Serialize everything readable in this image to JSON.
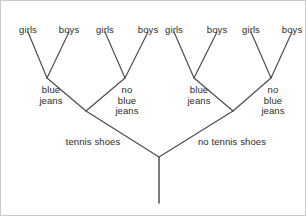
{
  "diagram": {
    "type": "dichotomous-classification-tree",
    "line_color": "#4a4a4a",
    "background_color": "#ffffff",
    "text_color": "#2b2b2b",
    "leaves": [
      {
        "id": "leaf-1",
        "label": "girls",
        "x": 27,
        "y": 24
      },
      {
        "id": "leaf-2",
        "label": "boys",
        "x": 68,
        "y": 24
      },
      {
        "id": "leaf-3",
        "label": "girls",
        "x": 104,
        "y": 24
      },
      {
        "id": "leaf-4",
        "label": "boys",
        "x": 147,
        "y": 24
      },
      {
        "id": "leaf-5",
        "label": "girls",
        "x": 173,
        "y": 24
      },
      {
        "id": "leaf-6",
        "label": "boys",
        "x": 216,
        "y": 24
      },
      {
        "id": "leaf-7",
        "label": "girls",
        "x": 250,
        "y": 24
      },
      {
        "id": "leaf-8",
        "label": "boys",
        "x": 291,
        "y": 24
      }
    ],
    "mid_labels": [
      {
        "id": "mid-1",
        "label": "blue\njeans",
        "x": 50,
        "y": 84
      },
      {
        "id": "mid-2",
        "label": "no\nblue\njeans",
        "x": 126,
        "y": 84
      },
      {
        "id": "mid-3",
        "label": "blue\njeans",
        "x": 198,
        "y": 84
      },
      {
        "id": "mid-4",
        "label": "no\nblue\njeans",
        "x": 272,
        "y": 84
      }
    ],
    "base_labels": [
      {
        "id": "base-1",
        "label": "tennis shoes",
        "x": 92,
        "y": 136
      },
      {
        "id": "base-2",
        "label": "no tennis shoes",
        "x": 231,
        "y": 136
      }
    ],
    "edges": [
      {
        "id": "edge-leaf1",
        "from": [
          27,
          31
        ],
        "to": [
          46,
          77
        ]
      },
      {
        "id": "edge-leaf2",
        "from": [
          68,
          31
        ],
        "to": [
          46,
          77
        ]
      },
      {
        "id": "edge-leaf3",
        "from": [
          104,
          31
        ],
        "to": [
          124,
          77
        ]
      },
      {
        "id": "edge-leaf4",
        "from": [
          147,
          31
        ],
        "to": [
          124,
          77
        ]
      },
      {
        "id": "edge-leaf5",
        "from": [
          173,
          31
        ],
        "to": [
          193,
          77
        ]
      },
      {
        "id": "edge-leaf6",
        "from": [
          216,
          31
        ],
        "to": [
          193,
          77
        ]
      },
      {
        "id": "edge-leaf7",
        "from": [
          250,
          31
        ],
        "to": [
          270,
          77
        ]
      },
      {
        "id": "edge-leaf8",
        "from": [
          291,
          31
        ],
        "to": [
          270,
          77
        ]
      },
      {
        "id": "edge-mid1",
        "from": [
          46,
          77
        ],
        "to": [
          85,
          110
        ]
      },
      {
        "id": "edge-mid2",
        "from": [
          124,
          77
        ],
        "to": [
          85,
          110
        ]
      },
      {
        "id": "edge-mid3",
        "from": [
          193,
          77
        ],
        "to": [
          232,
          110
        ]
      },
      {
        "id": "edge-mid4",
        "from": [
          270,
          77
        ],
        "to": [
          232,
          110
        ]
      },
      {
        "id": "edge-base1",
        "from": [
          85,
          110
        ],
        "to": [
          158,
          156
        ]
      },
      {
        "id": "edge-base2",
        "from": [
          232,
          110
        ],
        "to": [
          158,
          156
        ]
      }
    ],
    "root_stem": {
      "id": "root-stem",
      "from": [
        158,
        156
      ],
      "to": [
        158,
        202
      ]
    }
  }
}
